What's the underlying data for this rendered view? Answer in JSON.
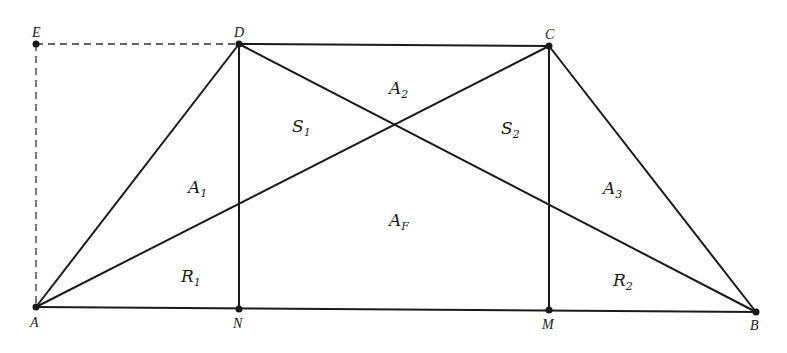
{
  "colors": {
    "line": "#1a1a1a",
    "dashed": "#333333",
    "background": "#ffffff"
  },
  "points": {
    "E": {
      "label": "E",
      "x": 36,
      "y": 44
    },
    "D": {
      "label": "D",
      "x": 239,
      "y": 44
    },
    "C": {
      "label": "C",
      "x": 549,
      "y": 46
    },
    "A": {
      "label": "A",
      "x": 36,
      "y": 307
    },
    "N": {
      "label": "N",
      "x": 239,
      "y": 309
    },
    "M": {
      "label": "M",
      "x": 549,
      "y": 310
    },
    "B": {
      "label": "B",
      "x": 756,
      "y": 312
    }
  },
  "regions": {
    "A1": {
      "base": "A",
      "sub": "1"
    },
    "A2": {
      "base": "A",
      "sub": "2"
    },
    "A3": {
      "base": "A",
      "sub": "3"
    },
    "AF": {
      "base": "A",
      "sub": "F"
    },
    "S1": {
      "base": "S",
      "sub": "1"
    },
    "S2": {
      "base": "S",
      "sub": "2"
    },
    "R1": {
      "base": "R",
      "sub": "1"
    },
    "R2": {
      "base": "R",
      "sub": "2"
    }
  }
}
